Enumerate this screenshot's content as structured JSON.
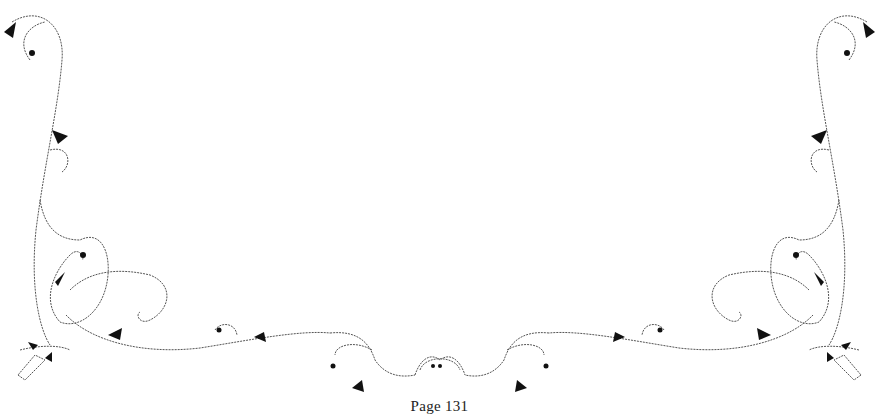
{
  "page": {
    "footer": "Page 131",
    "ornament": "floral-vine-border",
    "colors": {
      "background": "#ffffff",
      "ink": "#111111",
      "line": "#555555"
    }
  }
}
